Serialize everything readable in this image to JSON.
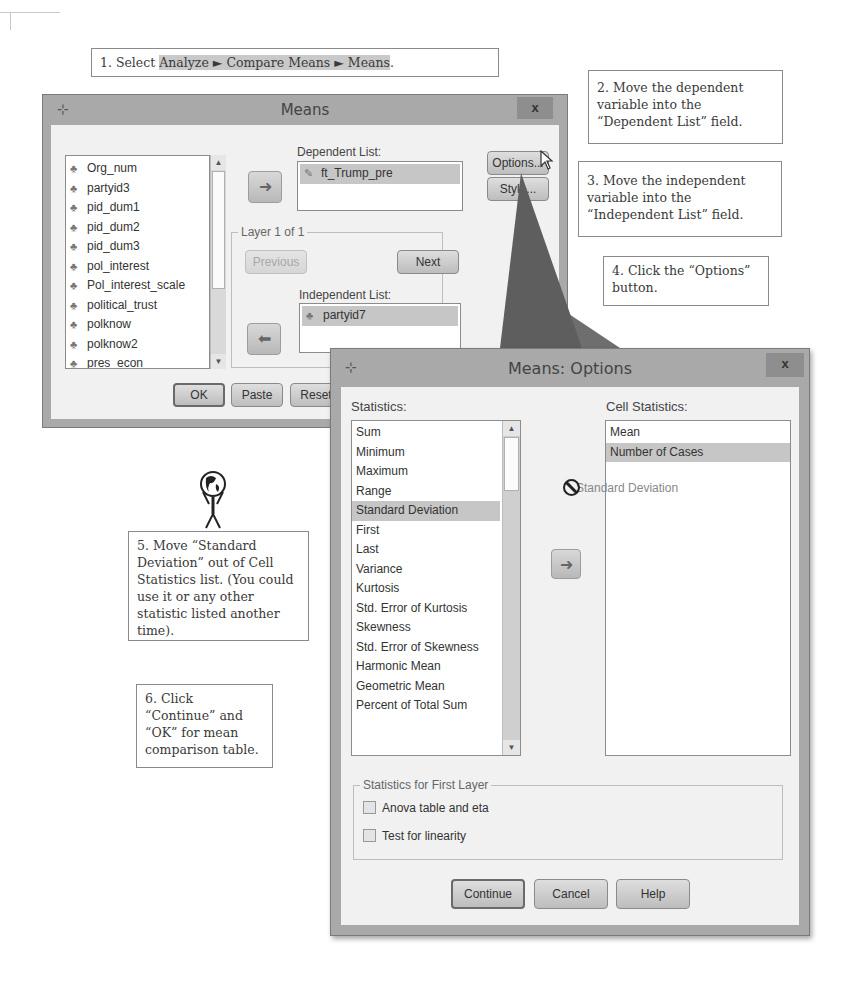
{
  "callouts": {
    "step1": {
      "prefix": "1. Select ",
      "menu_path": [
        "Analyze",
        "Compare Means",
        "Means"
      ],
      "separator": " ► ",
      "suffix": "."
    },
    "step2": "2. Move the dependent variable into the “Dependent List” field.",
    "step3": "3. Move the independent variable into the “Independent List” field.",
    "step4": "4. Click the “Options” button.",
    "step5": "5. Move “Standard Deviation” out of Cell Statistics list. (You could use it or any other statistic listed another time).",
    "step6": "6. Click “Continue” and “OK” for mean comparison table."
  },
  "means_dialog": {
    "title": "Means",
    "close_label": "x",
    "variables": [
      "Org_num",
      "partyid3",
      "pid_dum1",
      "pid_dum2",
      "pid_dum3",
      "pol_interest",
      "Pol_interest_scale",
      "political_trust",
      "polknow",
      "polknow2",
      "pres_econ"
    ],
    "dependent_list_label": "Dependent List:",
    "dependent_list": [
      "ft_Trump_pre"
    ],
    "layer_label": "Layer 1 of 1",
    "previous_label": "Previous",
    "next_label": "Next",
    "independent_list_label": "Independent List:",
    "independent_list": [
      "partyid7"
    ],
    "buttons": {
      "options": "Options...",
      "style": "Style...",
      "ok": "OK",
      "paste": "Paste",
      "reset": "Reset"
    },
    "move_arrow": "➜"
  },
  "options_dialog": {
    "title": "Means: Options",
    "close_label": "x",
    "statistics_label": "Statistics:",
    "statistics": [
      "Sum",
      "Minimum",
      "Maximum",
      "Range",
      "Standard Deviation",
      "First",
      "Last",
      "Variance",
      "Kurtosis",
      "Std. Error of Kurtosis",
      "Skewness",
      "Std. Error of Skewness",
      "Harmonic Mean",
      "Geometric Mean",
      "Percent of Total Sum"
    ],
    "statistics_selected": "Standard Deviation",
    "cell_statistics_label": "Cell Statistics:",
    "cell_statistics": [
      "Mean",
      "Number of Cases"
    ],
    "cell_statistics_selected": "Number of Cases",
    "drag_ghost": "Standard Deviation",
    "first_layer_group": "Statistics for First Layer",
    "anova_label": "Anova table and eta",
    "anova_checked": false,
    "linearity_label": "Test for linearity",
    "linearity_checked": false,
    "buttons": {
      "continue": "Continue",
      "cancel": "Cancel",
      "help": "Help"
    },
    "move_arrow": "➜"
  }
}
